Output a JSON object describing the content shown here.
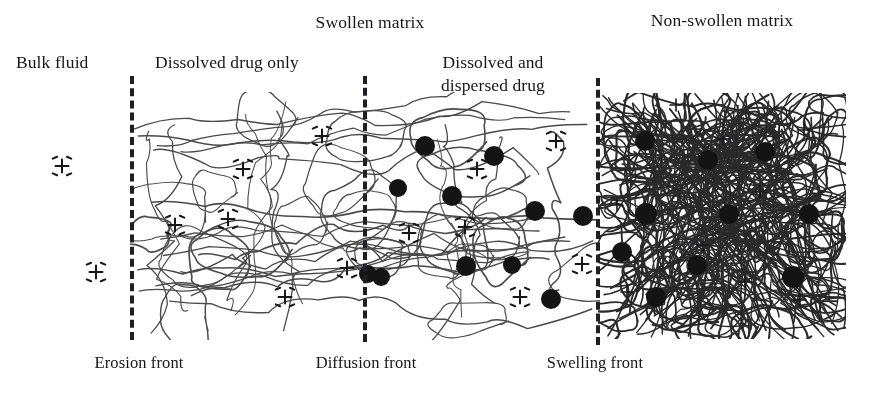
{
  "figure": {
    "title_region_labels": {
      "swollen_matrix": "Swollen matrix",
      "non_swollen_matrix": "Non-swollen matrix"
    },
    "zone_labels": {
      "bulk_fluid": "Bulk fluid",
      "dissolved_drug_only": "Dissolved drug only",
      "dissolved_and_dispersed_line1": "Dissolved and",
      "dissolved_and_dispersed_line2": "dispersed drug"
    },
    "front_labels": {
      "erosion_front": "Erosion front",
      "diffusion_front": "Diffusion front",
      "swelling_front": "Swelling front"
    },
    "colors": {
      "background": "#ffffff",
      "ink": "#17171a",
      "dashed_front": "#202024",
      "dispersed_drug_dot": "#141414",
      "polymer_chain_light": "#4a4a4a",
      "polymer_chain_dense": "#2a2a2a"
    },
    "fronts": [
      {
        "name": "erosion-front",
        "x": 132,
        "y_top": 76,
        "y_bottom": 340
      },
      {
        "name": "diffusion-front",
        "x": 365,
        "y_top": 76,
        "y_bottom": 342
      },
      {
        "name": "swelling-front",
        "x": 598,
        "y_top": 78,
        "y_bottom": 345
      }
    ],
    "matrix_extent": {
      "left": 132,
      "right": 842,
      "top": 95,
      "bottom": 335
    },
    "bulk_fluid_dissolved_drug": [
      {
        "x": 62,
        "y": 166
      },
      {
        "x": 96,
        "y": 272
      }
    ],
    "swollen_dissolved_only_drug": [
      {
        "x": 243,
        "y": 169
      },
      {
        "x": 322,
        "y": 136
      },
      {
        "x": 175,
        "y": 225
      },
      {
        "x": 228,
        "y": 219
      },
      {
        "x": 347,
        "y": 268
      },
      {
        "x": 285,
        "y": 297
      }
    ],
    "dissolved_dispersed_dissolved_drug": [
      {
        "x": 477,
        "y": 169
      },
      {
        "x": 556,
        "y": 141
      },
      {
        "x": 409,
        "y": 233
      },
      {
        "x": 465,
        "y": 227
      },
      {
        "x": 582,
        "y": 264
      },
      {
        "x": 520,
        "y": 297
      }
    ],
    "dissolved_dispersed_dots": [
      {
        "x": 425,
        "y": 146,
        "r": 10
      },
      {
        "x": 494,
        "y": 156,
        "r": 10
      },
      {
        "x": 398,
        "y": 188,
        "r": 9
      },
      {
        "x": 452,
        "y": 196,
        "r": 10
      },
      {
        "x": 535,
        "y": 211,
        "r": 10
      },
      {
        "x": 583,
        "y": 216,
        "r": 10
      },
      {
        "x": 381,
        "y": 277,
        "r": 9
      },
      {
        "x": 466,
        "y": 266,
        "r": 10
      },
      {
        "x": 512,
        "y": 265,
        "r": 9
      },
      {
        "x": 551,
        "y": 299,
        "r": 10
      },
      {
        "x": 368,
        "y": 274,
        "r": 9
      }
    ],
    "non_swollen_dots": [
      {
        "x": 645,
        "y": 141,
        "r": 10
      },
      {
        "x": 708,
        "y": 160,
        "r": 10
      },
      {
        "x": 765,
        "y": 152,
        "r": 10
      },
      {
        "x": 646,
        "y": 214,
        "r": 11
      },
      {
        "x": 729,
        "y": 214,
        "r": 10
      },
      {
        "x": 809,
        "y": 214,
        "r": 10
      },
      {
        "x": 622,
        "y": 252,
        "r": 10
      },
      {
        "x": 697,
        "y": 265,
        "r": 10
      },
      {
        "x": 793,
        "y": 277,
        "r": 11
      },
      {
        "x": 656,
        "y": 297,
        "r": 10
      }
    ],
    "non_swollen_plus": [
      {
        "x": 676,
        "y": 105
      },
      {
        "x": 723,
        "y": 139
      },
      {
        "x": 804,
        "y": 130
      },
      {
        "x": 617,
        "y": 205
      },
      {
        "x": 760,
        "y": 192
      },
      {
        "x": 703,
        "y": 245
      },
      {
        "x": 745,
        "y": 282
      },
      {
        "x": 627,
        "y": 292
      },
      {
        "x": 800,
        "y": 300
      }
    ]
  }
}
